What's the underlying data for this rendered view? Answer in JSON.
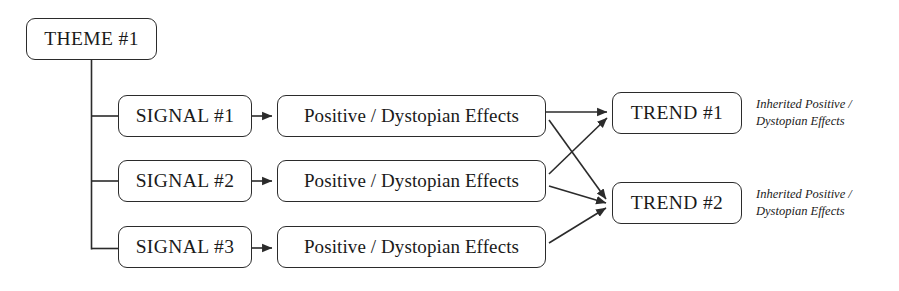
{
  "diagram": {
    "type": "flow-diagram",
    "title_node": {
      "id": "theme-1",
      "label": "THEME #1",
      "x": 26,
      "y": 18,
      "w": 131,
      "h": 42
    },
    "signals": [
      {
        "id": "signal-1",
        "label": "SIGNAL #1",
        "x": 118,
        "y": 95,
        "w": 134,
        "h": 42
      },
      {
        "id": "signal-2",
        "label": "SIGNAL #2",
        "x": 118,
        "y": 160,
        "w": 134,
        "h": 42
      },
      {
        "id": "signal-3",
        "label": "SIGNAL #3",
        "x": 118,
        "y": 226,
        "w": 134,
        "h": 42
      }
    ],
    "effects": [
      {
        "id": "effect-1",
        "label": "Positive / Dystopian Effects",
        "x": 277,
        "y": 95,
        "w": 269,
        "h": 42
      },
      {
        "id": "effect-2",
        "label": "Positive / Dystopian Effects",
        "x": 277,
        "y": 160,
        "w": 269,
        "h": 42
      },
      {
        "id": "effect-3",
        "label": "Positive / Dystopian Effects",
        "x": 277,
        "y": 226,
        "w": 269,
        "h": 42
      }
    ],
    "trends": [
      {
        "id": "trend-1",
        "label": "TREND #1",
        "x": 612,
        "y": 92,
        "w": 130,
        "h": 42
      },
      {
        "id": "trend-2",
        "label": "TREND #2",
        "x": 612,
        "y": 182,
        "w": 130,
        "h": 42
      }
    ],
    "annotations": [
      {
        "id": "annotation-trend-1",
        "line_1": "Inherited Positive /",
        "line_2": "Dystopian Effects",
        "x": 756,
        "y": 96
      },
      {
        "id": "annotation-trend-2",
        "line_1": "Inherited Positive /",
        "line_2": "Dystopian Effects",
        "x": 756,
        "y": 186
      }
    ],
    "colors": {
      "background": "#ffffff",
      "stroke": "#2b2b2b",
      "text": "#1a1a1a"
    },
    "connections": [
      {
        "from": "theme-1",
        "to": "signal-1",
        "style": "elbow"
      },
      {
        "from": "theme-1",
        "to": "signal-2",
        "style": "elbow"
      },
      {
        "from": "theme-1",
        "to": "signal-3",
        "style": "elbow"
      },
      {
        "from": "signal-1",
        "to": "effect-1",
        "style": "arrow"
      },
      {
        "from": "signal-2",
        "to": "effect-2",
        "style": "arrow"
      },
      {
        "from": "signal-3",
        "to": "effect-3",
        "style": "arrow"
      },
      {
        "from": "effect-1",
        "to": "trend-1",
        "style": "arrow"
      },
      {
        "from": "effect-1",
        "to": "trend-2",
        "style": "arrow"
      },
      {
        "from": "effect-2",
        "to": "trend-1",
        "style": "arrow"
      },
      {
        "from": "effect-2",
        "to": "trend-2",
        "style": "arrow"
      },
      {
        "from": "effect-3",
        "to": "trend-2",
        "style": "arrow"
      }
    ]
  }
}
